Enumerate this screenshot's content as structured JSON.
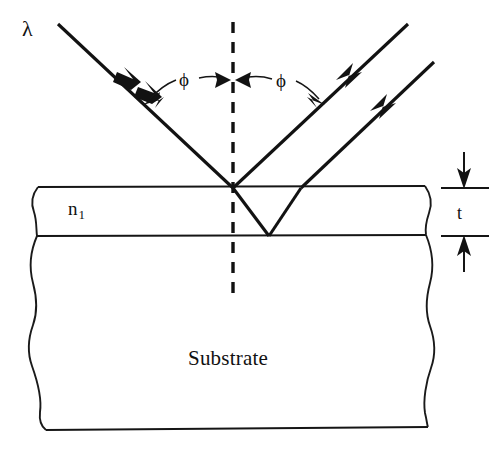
{
  "figure": {
    "kind": "optics-ray-diagram",
    "topic": "thin-film interference on a substrate",
    "background_color": "#ffffff",
    "ink_color": "#121212"
  },
  "labels": {
    "wavelength": "λ",
    "angle_incidence": "ϕ",
    "angle_reflection": "ϕ",
    "film_index": "n",
    "film_index_subscript": "1",
    "thickness": "t",
    "substrate": "Substrate"
  },
  "geometry": {
    "film_top_y": 188,
    "film_bottom_y": 236,
    "substrate_bottom_y": 430,
    "left_edge_x": 36,
    "right_edge_x": 425,
    "normal_x": 233,
    "normal_top_y": 22,
    "normal_bottom_y": 296,
    "incidence_point": [
      233,
      188
    ],
    "internal_reflection_point": [
      268,
      236
    ],
    "exit_point": [
      300,
      188
    ],
    "thickness_marker_x": 464
  },
  "rays": [
    {
      "name": "incident-ray",
      "from": [
        58,
        24
      ],
      "to": [
        233,
        188
      ],
      "arrow_positions": [
        0.38,
        0.52
      ],
      "arrow_direction": "down-right"
    },
    {
      "name": "reflected-ray",
      "from": [
        233,
        188
      ],
      "to": [
        408,
        24
      ],
      "arrow_positions": [
        0.55
      ],
      "arrow_direction": "up-right"
    },
    {
      "name": "refracted-ray",
      "from": [
        233,
        188
      ],
      "to": [
        268,
        236
      ],
      "arrow_positions": [],
      "arrow_direction": "down-right"
    },
    {
      "name": "internally-reflected-ray",
      "from": [
        268,
        236
      ],
      "to": [
        300,
        188
      ],
      "arrow_positions": [],
      "arrow_direction": "up-right"
    },
    {
      "name": "emergent-ray",
      "from": [
        300,
        188
      ],
      "to": [
        432,
        64
      ],
      "arrow_positions": [
        0.55
      ],
      "arrow_direction": "up-right"
    }
  ],
  "annotations": {
    "phi_left": {
      "label": "ϕ",
      "leader_to_ray": [
        148,
        98
      ],
      "leader_to_normal": [
        228,
        80
      ]
    },
    "phi_right": {
      "label": "ϕ",
      "leader_to_normal": [
        240,
        80
      ],
      "leader_to_ray": [
        318,
        99
      ]
    },
    "thickness": {
      "label": "t",
      "top_tick_y": 188,
      "bottom_tick_y": 236,
      "arrow_top_direction": "down",
      "arrow_bottom_direction": "up"
    }
  }
}
